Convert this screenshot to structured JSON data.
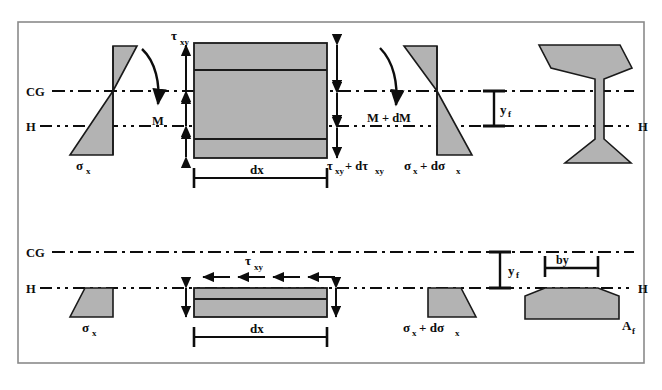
{
  "figure": {
    "background_color": "#ffffff",
    "border_color": "#8a8a8a",
    "shape_fill": "#b3b3b3",
    "shape_stroke": "#1a1a1a",
    "line_color": "#0d0d0d"
  },
  "labels": {
    "cg_top": "CG",
    "cg_bottom": "CG",
    "h_left_top": "H",
    "h_left_bottom": "H",
    "h_right_top": "H",
    "h_right_bottom": "H",
    "tau_xy_top": "τ",
    "tau_xy_top_sub": "xy",
    "tau_xy_lower": "τ",
    "tau_xy_lower_sub": "xy",
    "tau_plus_dtau": "τ",
    "tau_plus_dtau_sub1": "xy",
    "tau_plus_dtau_mid": "+ dτ",
    "tau_plus_dtau_sub2": "xy",
    "moment_left": "M",
    "moment_right": "M + dM",
    "sigma_x_top_left": "σ",
    "sigma_x_top_left_sub": "x",
    "sigma_x_top_right": "σ",
    "sigma_x_top_right_sub1": "x",
    "sigma_x_top_right_mid": "+ dσ",
    "sigma_x_top_right_sub2": "x",
    "sigma_x_bot_left": "σ",
    "sigma_x_bot_left_sub": "x",
    "sigma_x_bot_right": "σ",
    "sigma_x_bot_right_sub1": "x",
    "sigma_x_bot_right_mid": "+ dσ",
    "sigma_x_bot_right_sub2": "x",
    "dx_top": "dx",
    "dx_bottom": "dx",
    "y_f_top": "y",
    "y_f_top_sub": "f",
    "y_f_bottom": "y",
    "y_f_bottom_sub": "f",
    "by": "by",
    "a_f": "A",
    "a_f_sub": "f"
  },
  "elements": {
    "top_row": {
      "stress_block_left_name": "bending-stress-bowtie-left",
      "beam_element_name": "beam-element-top",
      "stress_block_right_name": "bending-stress-bowtie-right",
      "cross_section_name": "i-beam-cross-section"
    },
    "bottom_row": {
      "stress_block_left_name": "flange-stress-trapezoid-left",
      "flange_element_name": "flange-element-bottom",
      "stress_block_right_name": "flange-stress-trapezoid-right",
      "flange_area_name": "flange-area-af"
    }
  },
  "geometry": {
    "cg_line_y_top": 91,
    "h_line_y_top": 126,
    "cg_line_y_bottom": 252,
    "h_line_y_bottom": 288,
    "shear_arrow_count": 4
  }
}
